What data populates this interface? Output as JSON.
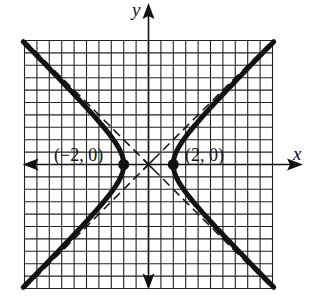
{
  "chart_data": {
    "type": "line",
    "title": "",
    "equation": "x^2/4 - y^2/4 = 1",
    "xlabel": "x",
    "ylabel": "y",
    "xlim": [
      -10,
      10
    ],
    "ylim": [
      -10,
      10
    ],
    "grid": true,
    "grid_step": 1,
    "series": [
      {
        "name": "hyperbola-right-branch",
        "style": "solid-thick",
        "a": 2,
        "b": 2,
        "branch": "right"
      },
      {
        "name": "hyperbola-left-branch",
        "style": "solid-thick",
        "a": 2,
        "b": 2,
        "branch": "left"
      },
      {
        "name": "asymptote-positive",
        "style": "dashed",
        "equation": "y = x"
      },
      {
        "name": "asymptote-negative",
        "style": "dashed",
        "equation": "y = -x"
      }
    ],
    "points": [
      {
        "label": "(−2, 0)",
        "x": -2,
        "y": 0
      },
      {
        "label": "(2, 0)",
        "x": 2,
        "y": 0
      }
    ],
    "annotations": [
      "center marked with asterisk at (0, 0)"
    ]
  },
  "labels": {
    "x_axis": "x",
    "y_axis": "y",
    "vertex_left": "(−2, 0)",
    "vertex_right": "(2, 0)"
  },
  "colors": {
    "ink": "#111111",
    "grid": "#222222",
    "background": "#ffffff"
  }
}
